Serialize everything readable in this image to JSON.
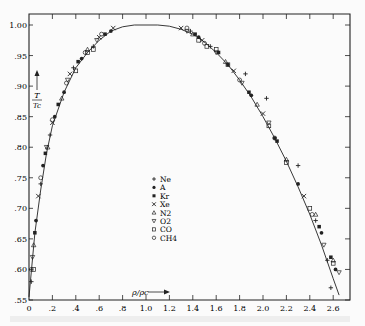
{
  "chart_data": {
    "type": "scatter",
    "title": "",
    "xlabel": "ρ/ρc",
    "ylabel": "T/Tc",
    "xlim": [
      0,
      2.7
    ],
    "ylim": [
      0.55,
      1.0
    ],
    "x_ticks": [
      "0",
      ".2",
      ".4",
      ".6",
      ".8",
      "1.0",
      "1.2",
      "1.4",
      "1.6",
      "1.8",
      "2.0",
      "2.2",
      "2.4",
      "2.6"
    ],
    "x_tick_values": [
      0,
      0.2,
      0.4,
      0.6,
      0.8,
      1.0,
      1.2,
      1.4,
      1.6,
      1.8,
      2.0,
      2.2,
      2.4,
      2.6
    ],
    "y_ticks": [
      "1.00",
      ".95",
      ".90",
      ".85",
      ".80",
      ".75",
      ".70",
      ".65",
      ".60",
      ".55"
    ],
    "y_tick_values": [
      1.0,
      0.95,
      0.9,
      0.85,
      0.8,
      0.75,
      0.7,
      0.65,
      0.6,
      0.55
    ],
    "grid": false,
    "legend_position": "center",
    "legend": [
      {
        "marker": "+",
        "label": "Ne"
      },
      {
        "marker": "●",
        "label": "A"
      },
      {
        "marker": "■",
        "label": "Kr"
      },
      {
        "marker": "x",
        "label": "Xe"
      },
      {
        "marker": "△",
        "label": "N2"
      },
      {
        "marker": "▽",
        "label": "O2"
      },
      {
        "marker": "□",
        "label": "CO"
      },
      {
        "marker": "○",
        "label": "CH4"
      }
    ],
    "fit_curve": {
      "description": "coexistence curve fitted through all gases",
      "x": [
        0.0,
        0.05,
        0.1,
        0.15,
        0.2,
        0.3,
        0.4,
        0.5,
        0.6,
        0.7,
        0.8,
        0.9,
        1.0,
        1.1,
        1.2,
        1.3,
        1.4,
        1.5,
        1.6,
        1.7,
        1.8,
        1.9,
        2.0,
        2.1,
        2.2,
        2.3,
        2.4,
        2.5,
        2.6,
        2.65
      ],
      "y": [
        0.555,
        0.66,
        0.73,
        0.79,
        0.835,
        0.89,
        0.93,
        0.955,
        0.975,
        0.99,
        0.997,
        1.0,
        1.0,
        1.0,
        0.998,
        0.993,
        0.985,
        0.972,
        0.955,
        0.935,
        0.91,
        0.882,
        0.85,
        0.815,
        0.777,
        0.735,
        0.69,
        0.64,
        0.585,
        0.558
      ]
    },
    "series": [
      {
        "name": "Ne",
        "marker": "+",
        "x": [
          0.02,
          0.1,
          0.18,
          0.38,
          0.55,
          1.38,
          1.55,
          1.85,
          2.03,
          2.3,
          2.45,
          2.55,
          2.58
        ],
        "y": [
          0.58,
          0.74,
          0.82,
          0.93,
          0.965,
          0.99,
          0.965,
          0.92,
          0.88,
          0.77,
          0.68,
          0.615,
          0.57
        ]
      },
      {
        "name": "A",
        "marker": "●",
        "x": [
          0.06,
          0.12,
          0.22,
          0.3,
          0.45,
          0.7,
          1.45,
          1.7,
          1.9,
          2.1,
          2.3,
          2.5,
          2.62
        ],
        "y": [
          0.68,
          0.77,
          0.85,
          0.89,
          0.945,
          0.99,
          0.98,
          0.935,
          0.885,
          0.815,
          0.74,
          0.66,
          0.6
        ]
      },
      {
        "name": "Kr",
        "marker": "■",
        "x": [
          0.05,
          0.14,
          0.25,
          0.42,
          0.65,
          1.42,
          1.62,
          1.88,
          2.12,
          2.48,
          2.58
        ],
        "y": [
          0.66,
          0.79,
          0.87,
          0.94,
          0.985,
          0.985,
          0.955,
          0.89,
          0.81,
          0.67,
          0.62
        ]
      },
      {
        "name": "Xe",
        "marker": "x",
        "x": [
          0.08,
          0.2,
          0.35,
          0.6,
          0.72,
          1.3,
          1.48,
          1.75,
          2.0,
          2.35
        ],
        "y": [
          0.72,
          0.84,
          0.92,
          0.98,
          0.995,
          0.995,
          0.975,
          0.925,
          0.855,
          0.72
        ]
      },
      {
        "name": "N2",
        "marker": "△",
        "x": [
          0.04,
          0.16,
          0.28,
          0.5,
          1.4,
          1.68,
          1.95,
          2.2,
          2.45,
          2.6
        ],
        "y": [
          0.64,
          0.8,
          0.88,
          0.96,
          0.985,
          0.94,
          0.87,
          0.78,
          0.69,
          0.615
        ]
      },
      {
        "name": "O2",
        "marker": "▽",
        "x": [
          0.03,
          0.15,
          0.33,
          0.58,
          1.35,
          1.6,
          1.82,
          2.05,
          2.52,
          2.65
        ],
        "y": [
          0.62,
          0.8,
          0.91,
          0.975,
          0.99,
          0.955,
          0.905,
          0.84,
          0.64,
          0.595
        ]
      },
      {
        "name": "CO",
        "marker": "□",
        "x": [
          0.04,
          0.4,
          0.5,
          0.55,
          1.45,
          1.52,
          1.6,
          1.7,
          2.05,
          2.2,
          2.4,
          2.6
        ],
        "y": [
          0.6,
          0.925,
          0.955,
          0.96,
          0.975,
          0.965,
          0.96,
          0.935,
          0.835,
          0.775,
          0.7,
          0.61
        ]
      },
      {
        "name": "CH4",
        "marker": "○",
        "x": [
          0.02,
          0.1,
          0.2,
          0.32,
          0.48,
          0.62,
          1.35,
          1.5,
          1.8,
          2.1,
          2.42
        ],
        "y": [
          0.6,
          0.75,
          0.845,
          0.905,
          0.955,
          0.985,
          0.995,
          0.97,
          0.91,
          0.815,
          0.69
        ]
      }
    ],
    "annotations": [
      {
        "text": "T/Tc",
        "arrow": "up",
        "position": "left inside plot near y=0.87–0.93"
      },
      {
        "text": "ρ/ρc",
        "arrow": "right",
        "position": "bottom inside plot near x=1.0"
      }
    ]
  },
  "labels": {
    "y_axis_label_top": "T",
    "y_axis_label_bottom": "Tc",
    "x_axis_label": "ρ/ρc"
  }
}
